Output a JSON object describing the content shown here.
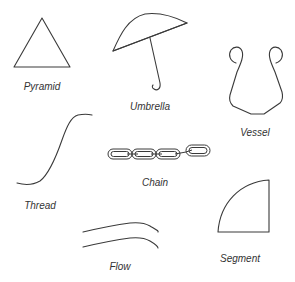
{
  "figure": {
    "stroke_color": "#3a3a3a",
    "label_color": "#333333",
    "background": "#ffffff",
    "items": [
      {
        "name": "pyramid",
        "label": "Pyramid",
        "shape": "triangle-icon"
      },
      {
        "name": "umbrella",
        "label": "Umbrella",
        "shape": "umbrella-icon"
      },
      {
        "name": "vessel",
        "label": "Vessel",
        "shape": "vessel-icon"
      },
      {
        "name": "thread",
        "label": "Thread",
        "shape": "s-curve-icon"
      },
      {
        "name": "chain",
        "label": "Chain",
        "shape": "chain-icon"
      },
      {
        "name": "flow",
        "label": "Flow",
        "shape": "parallel-curves-icon"
      },
      {
        "name": "segment",
        "label": "Segment",
        "shape": "quarter-circle-icon"
      }
    ]
  }
}
